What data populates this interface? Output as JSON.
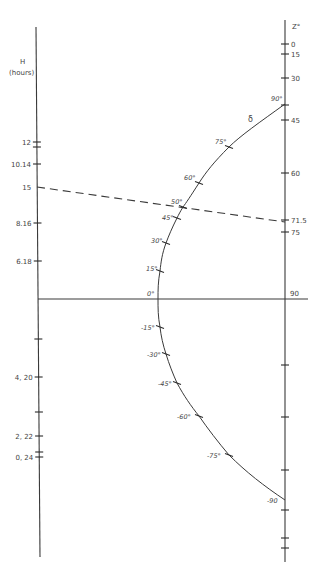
{
  "left_axis": {
    "title": "H",
    "subtitle": "(hours)",
    "ticks": [
      {
        "label": "12",
        "pos": 0.0
      },
      {
        "label": "",
        "pos": 0.5
      },
      {
        "label": "10.14",
        "pos": 1.0
      },
      {
        "label": "15",
        "pos": 2.0,
        "note": "dashed line start"
      },
      {
        "label": "8.16",
        "pos": 3.0
      },
      {
        "label": "6.18",
        "pos": 4.0
      },
      {
        "label": "",
        "pos": 6.0
      },
      {
        "label": "4, 20",
        "pos": 7.0
      },
      {
        "label": "",
        "pos": 8.0
      },
      {
        "label": "2, 22",
        "pos": 8.6
      },
      {
        "label": "",
        "pos": 9.0
      },
      {
        "label": "0, 24",
        "pos": 9.2
      }
    ]
  },
  "right_axis": {
    "title": "Z°",
    "ticks": [
      {
        "label": "0"
      },
      {
        "label": "15"
      },
      {
        "label": "30"
      },
      {
        "label": ""
      },
      {
        "label": "45"
      },
      {
        "label": "60"
      },
      {
        "label": "71.5"
      },
      {
        "label": "75"
      },
      {
        "label": "90"
      },
      {
        "label": ""
      },
      {
        "label": ""
      },
      {
        "label": ""
      },
      {
        "label": ""
      },
      {
        "label": ""
      },
      {
        "label": ""
      }
    ]
  },
  "curve": {
    "name": "δ",
    "points": [
      {
        "label": "90°",
        "delta": 90
      },
      {
        "label": "75°",
        "delta": 75
      },
      {
        "label": "60°",
        "delta": 60
      },
      {
        "label": "50°",
        "delta": 50
      },
      {
        "label": "45°",
        "delta": 45
      },
      {
        "label": "30°",
        "delta": 30
      },
      {
        "label": "15°",
        "delta": 15
      },
      {
        "label": "0°",
        "delta": 0
      },
      {
        "label": "-15°",
        "delta": -15
      },
      {
        "label": "-30°",
        "delta": -30
      },
      {
        "label": "-45°",
        "delta": -45
      },
      {
        "label": "-60°",
        "delta": -60
      },
      {
        "label": "-75°",
        "delta": -75
      },
      {
        "label": "-90",
        "delta": -90
      }
    ]
  },
  "dashed_line": {
    "from": "H = 15",
    "through": "δ = 50°",
    "to": "Z = 71.5"
  },
  "horizontal_axis": {
    "right_label": "90"
  }
}
